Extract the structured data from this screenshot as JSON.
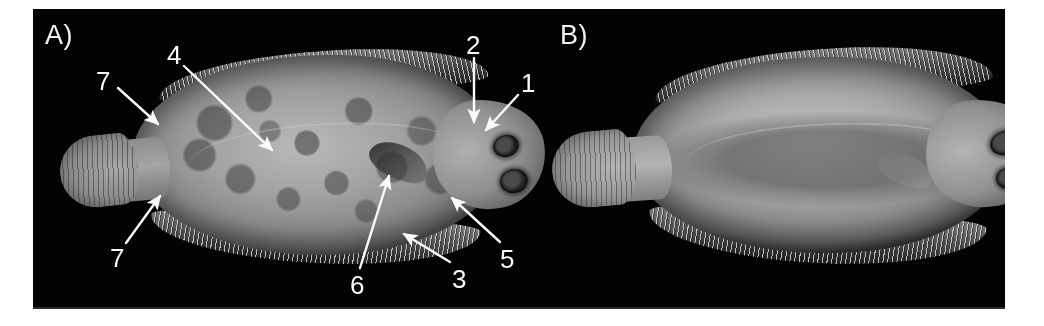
{
  "figure": {
    "background_color": "#ffffff",
    "plate_color": "#030303",
    "annotation_color": "#fbfbfb"
  },
  "panels": [
    {
      "id": "A",
      "label": "A)",
      "label_x": 45,
      "label_y": 22,
      "description": "ocular (pigmented) side of flatfish, head to the right, mottled dark-spotted skin"
    },
    {
      "id": "B",
      "label": "B)",
      "label_x": 560,
      "label_y": 22,
      "description": "blind (pale, unpigmented) side of flatfish, head to the right, smooth uniform skin"
    }
  ],
  "annotations": [
    {
      "id": "a-7-upper",
      "label": "7",
      "x": 96,
      "y": 68,
      "panel": "A",
      "arrow": {
        "x1": 118,
        "y1": 88,
        "x2": 158,
        "y2": 124
      }
    },
    {
      "id": "a-4",
      "label": "4",
      "x": 167,
      "y": 42,
      "panel": "A",
      "arrow": {
        "x1": 184,
        "y1": 66,
        "x2": 272,
        "y2": 150
      }
    },
    {
      "id": "a-2",
      "label": "2",
      "x": 466,
      "y": 32,
      "panel": "A",
      "arrow": {
        "x1": 474,
        "y1": 58,
        "x2": 474,
        "y2": 122
      }
    },
    {
      "id": "a-1",
      "label": "1",
      "x": 521,
      "y": 70,
      "panel": "A",
      "arrow": {
        "x1": 518,
        "y1": 95,
        "x2": 486,
        "y2": 130
      }
    },
    {
      "id": "a-7-lower",
      "label": "7",
      "x": 110,
      "y": 245,
      "panel": "A",
      "arrow": {
        "x1": 126,
        "y1": 243,
        "x2": 160,
        "y2": 196
      }
    },
    {
      "id": "a-6",
      "label": "6",
      "x": 350,
      "y": 272,
      "panel": "A",
      "arrow": {
        "x1": 360,
        "y1": 268,
        "x2": 389,
        "y2": 176
      }
    },
    {
      "id": "a-3",
      "label": "3",
      "x": 452,
      "y": 266,
      "panel": "A",
      "arrow": {
        "x1": 450,
        "y1": 262,
        "x2": 404,
        "y2": 234
      }
    },
    {
      "id": "a-5",
      "label": "5",
      "x": 500,
      "y": 246,
      "panel": "A",
      "arrow": {
        "x1": 500,
        "y1": 242,
        "x2": 452,
        "y2": 198
      }
    }
  ]
}
